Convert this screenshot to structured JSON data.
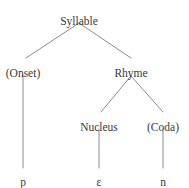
{
  "figure": {
    "kind": "syllable-structure-tree",
    "background_color": "#ffffff",
    "edge_color": "#8c8c8c",
    "text_color": "#3a3a3a",
    "width": 189,
    "height": 188
  },
  "nodes": [
    {
      "id": "syllable",
      "label": "Syllable",
      "x": 79,
      "y": 16,
      "level": 0
    },
    {
      "id": "onset",
      "label": "(Onset)",
      "x": 23,
      "y": 68,
      "level": 1
    },
    {
      "id": "rhyme",
      "label": "Rhyme",
      "x": 131,
      "y": 68,
      "level": 1
    },
    {
      "id": "nucleus",
      "label": "Nucleus",
      "x": 99,
      "y": 122,
      "level": 2
    },
    {
      "id": "coda",
      "label": "(Coda)",
      "x": 163,
      "y": 122,
      "level": 2
    },
    {
      "id": "seg-p",
      "label": "p",
      "x": 23,
      "y": 177,
      "level": 3
    },
    {
      "id": "seg-e",
      "label": "ɛ",
      "x": 99,
      "y": 177,
      "level": 3
    },
    {
      "id": "seg-n",
      "label": "n",
      "x": 163,
      "y": 177,
      "level": 3
    }
  ],
  "edges": [
    {
      "id": "syllable-onset",
      "from": "syllable",
      "to": "onset",
      "x1": 79,
      "y1": 23,
      "x2": 26,
      "y2": 58
    },
    {
      "id": "syllable-rhyme",
      "from": "syllable",
      "to": "rhyme",
      "x1": 79,
      "y1": 23,
      "x2": 131,
      "y2": 58
    },
    {
      "id": "rhyme-nucleus",
      "from": "rhyme",
      "to": "nucleus",
      "x1": 131,
      "y1": 76,
      "x2": 101,
      "y2": 112
    },
    {
      "id": "rhyme-coda",
      "from": "rhyme",
      "to": "coda",
      "x1": 131,
      "y1": 76,
      "x2": 163,
      "y2": 112
    },
    {
      "id": "onset-p",
      "from": "onset",
      "to": "seg-p",
      "x1": 23,
      "y1": 75,
      "x2": 23,
      "y2": 168
    },
    {
      "id": "nucleus-e",
      "from": "nucleus",
      "to": "seg-e",
      "x1": 99,
      "y1": 129,
      "x2": 99,
      "y2": 168
    },
    {
      "id": "coda-n",
      "from": "coda",
      "to": "seg-n",
      "x1": 163,
      "y1": 129,
      "x2": 163,
      "y2": 168
    }
  ]
}
